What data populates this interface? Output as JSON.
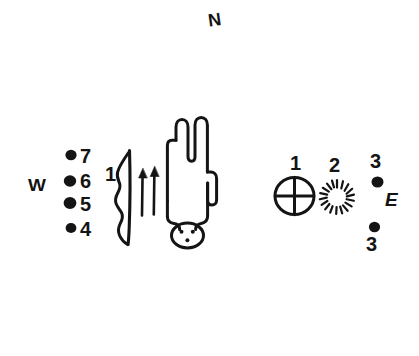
{
  "figure": {
    "background_color": "#ffffff",
    "ink_color": "#141414",
    "width": 419,
    "height": 356
  },
  "cardinal_labels": {
    "north": "N",
    "west": "W",
    "east": "E"
  },
  "west_group": {
    "dot_labels": [
      "7",
      "6",
      "5",
      "4"
    ]
  },
  "center_group": {
    "bow_label": "1"
  },
  "east_group": {
    "crossed_circle_label": "1",
    "sunburst_label": "2",
    "upper_dot_label": "3",
    "lower_dot_label": "3"
  },
  "glyph_names": {
    "bow": "bow-glyph",
    "arrows": "arrows-glyph",
    "cactus": "saguaro-cactus-glyph",
    "crossed_circle": "crossed-circle-glyph",
    "sunburst": "sunburst-glyph",
    "dot": "dot-glyph"
  }
}
